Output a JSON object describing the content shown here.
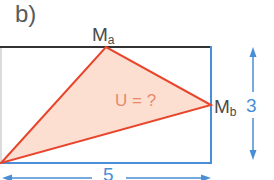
{
  "part_label": "b)",
  "points": {
    "ma": {
      "letter": "M",
      "sub": "a"
    },
    "mb": {
      "letter": "M",
      "sub": "b"
    }
  },
  "triangle_label": "U = ?",
  "dimensions": {
    "width": "5",
    "height": "3"
  },
  "colors": {
    "rect_top": "#333333",
    "rect_sides": "#4a8fd6",
    "rect_left": "#cccccc",
    "triangle_stroke": "#e8452c",
    "triangle_fill": "#fbd9c9",
    "dimension": "#4a8fd6"
  }
}
